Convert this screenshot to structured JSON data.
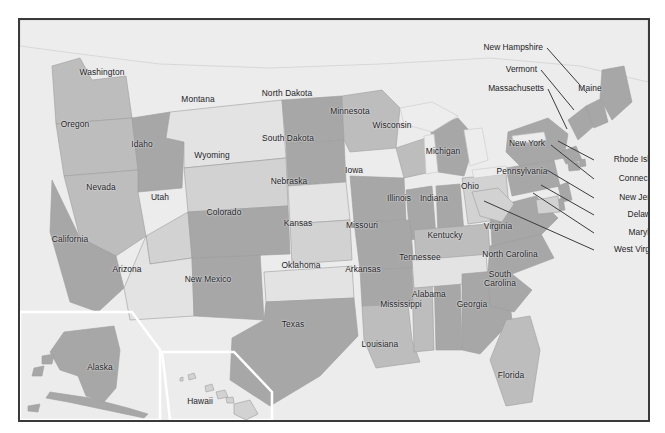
{
  "map": {
    "title": "United States map with state labels",
    "frame_color": "#3a3a3c",
    "background_color": "#ececed",
    "label_color": "#1d1d1f",
    "inset_outline_color": "#ffffff",
    "leader_line_color": "#3c3c3e",
    "palette": {
      "very_light": "#e3e3e4",
      "light": "#d2d2d3",
      "mid": "#bdbdbe",
      "dark": "#a7a7a8",
      "darker": "#9a9a9b",
      "water": "#ededee",
      "ocean": "#e8e8e9"
    },
    "states": [
      {
        "name": "Washington",
        "lx": 100,
        "ly": 71,
        "tone": "mid"
      },
      {
        "name": "Oregon",
        "lx": 73,
        "ly": 123,
        "tone": "mid"
      },
      {
        "name": "Idaho",
        "lx": 140,
        "ly": 143,
        "tone": "dark"
      },
      {
        "name": "Montana",
        "lx": 196,
        "ly": 98,
        "tone": "very_light"
      },
      {
        "name": "Wyoming",
        "lx": 210,
        "ly": 154,
        "tone": "light"
      },
      {
        "name": "North Dakota",
        "lx": 285,
        "ly": 92,
        "tone": "dark"
      },
      {
        "name": "South Dakota",
        "lx": 286,
        "ly": 137,
        "tone": "dark"
      },
      {
        "name": "Nebraska",
        "lx": 287,
        "ly": 180,
        "tone": "very_light"
      },
      {
        "name": "Minnesota",
        "lx": 348,
        "ly": 110,
        "tone": "mid"
      },
      {
        "name": "Wisconsin",
        "lx": 390,
        "ly": 124,
        "tone": "mid"
      },
      {
        "name": "Iowa",
        "lx": 352,
        "ly": 169,
        "tone": "dark"
      },
      {
        "name": "Nevada",
        "lx": 99,
        "ly": 186,
        "tone": "mid"
      },
      {
        "name": "Utah",
        "lx": 158,
        "ly": 196,
        "tone": "light"
      },
      {
        "name": "Colorado",
        "lx": 222,
        "ly": 211,
        "tone": "dark"
      },
      {
        "name": "Kansas",
        "lx": 296,
        "ly": 222,
        "tone": "light"
      },
      {
        "name": "Missouri",
        "lx": 360,
        "ly": 224,
        "tone": "dark"
      },
      {
        "name": "Illinois",
        "lx": 397,
        "ly": 197,
        "tone": "dark"
      },
      {
        "name": "Indiana",
        "lx": 432,
        "ly": 197,
        "tone": "dark"
      },
      {
        "name": "Ohio",
        "lx": 468,
        "ly": 185,
        "tone": "light"
      },
      {
        "name": "Michigan",
        "lx": 441,
        "ly": 150,
        "tone": "dark"
      },
      {
        "name": "California",
        "lx": 68,
        "ly": 238,
        "tone": "dark"
      },
      {
        "name": "Arizona",
        "lx": 125,
        "ly": 268,
        "tone": "very_light"
      },
      {
        "name": "New Mexico",
        "lx": 206,
        "ly": 278,
        "tone": "dark"
      },
      {
        "name": "Oklahoma",
        "lx": 299,
        "ly": 264,
        "tone": "very_light"
      },
      {
        "name": "Arkansas",
        "lx": 361,
        "ly": 268,
        "tone": "dark"
      },
      {
        "name": "Texas",
        "lx": 291,
        "ly": 323,
        "tone": "dark"
      },
      {
        "name": "Louisiana",
        "lx": 378,
        "ly": 343,
        "tone": "mid"
      },
      {
        "name": "Mississippi",
        "lx": 399,
        "ly": 303,
        "tone": "mid"
      },
      {
        "name": "Alabama",
        "lx": 427,
        "ly": 293,
        "tone": "dark"
      },
      {
        "name": "Tennessee",
        "lx": 418,
        "ly": 256,
        "tone": "very_light"
      },
      {
        "name": "Kentucky",
        "lx": 443,
        "ly": 234,
        "tone": "mid"
      },
      {
        "name": "Georgia",
        "lx": 470,
        "ly": 303,
        "tone": "dark"
      },
      {
        "name": "Florida",
        "lx": 509,
        "ly": 374,
        "tone": "mid"
      },
      {
        "name": "Virginia",
        "lx": 496,
        "ly": 225,
        "tone": "dark"
      },
      {
        "name": "North Carolina",
        "lx": 508,
        "ly": 253,
        "tone": "dark"
      },
      {
        "name": "Pennsylvania",
        "lx": 520,
        "ly": 170,
        "tone": "dark"
      },
      {
        "name": "New York",
        "lx": 525,
        "ly": 142,
        "tone": "dark"
      },
      {
        "name": "Maine",
        "lx": 588,
        "ly": 87,
        "tone": "dark"
      }
    ],
    "states_wrapped": [
      {
        "name": "South\nCarolina",
        "line1": "South",
        "line2": "Carolina",
        "lx": 498,
        "ly": 277
      }
    ],
    "insets": [
      {
        "name": "Alaska",
        "lx": 98,
        "ly": 366
      },
      {
        "name": "Hawaii",
        "lx": 198,
        "ly": 400
      }
    ],
    "callouts_left": [
      {
        "name": "New Hampshire",
        "tx": 541,
        "ty": 46,
        "x1": 545,
        "y1": 46,
        "x2": 585,
        "y2": 91
      },
      {
        "name": "Vermont",
        "tx": 535,
        "ty": 68,
        "x1": 539,
        "y1": 68,
        "x2": 572,
        "y2": 108
      },
      {
        "name": "Massachusetts",
        "tx": 542,
        "ty": 87,
        "x1": 546,
        "y1": 87,
        "x2": 565,
        "y2": 127
      }
    ],
    "callouts_right": [
      {
        "name": "Rhode Island",
        "tx": 661,
        "ty": 158,
        "x1": 592,
        "y1": 158,
        "x2": 556,
        "y2": 139
      },
      {
        "name": "Connecticut",
        "tx": 661,
        "ty": 177,
        "x1": 592,
        "y1": 177,
        "x2": 549,
        "y2": 143
      },
      {
        "name": "New Jersey",
        "tx": 661,
        "ty": 196,
        "x1": 592,
        "y1": 196,
        "x2": 545,
        "y2": 168
      },
      {
        "name": "Delaware",
        "tx": 661,
        "ty": 213,
        "x1": 592,
        "y1": 213,
        "x2": 539,
        "y2": 183
      },
      {
        "name": "Maryland",
        "tx": 661,
        "ty": 231,
        "x1": 592,
        "y1": 231,
        "x2": 531,
        "y2": 191
      },
      {
        "name": "West Virginia",
        "tx": 661,
        "ty": 248,
        "x1": 592,
        "y1": 248,
        "x2": 482,
        "y2": 199
      }
    ]
  }
}
